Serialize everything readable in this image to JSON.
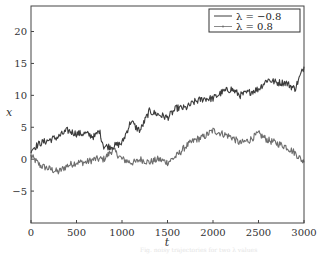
{
  "chart_data": {
    "type": "line",
    "title": "",
    "xlabel": "t",
    "ylabel": "x",
    "xlim": [
      0,
      3000
    ],
    "ylim": [
      -10,
      24
    ],
    "xticks": [
      0,
      500,
      1000,
      1500,
      2000,
      2500,
      3000
    ],
    "yticks": [
      -5,
      0,
      5,
      10,
      15,
      20
    ],
    "xtick_labels": [
      "0",
      "500",
      "1000",
      "1500",
      "2000",
      "2500",
      "3000"
    ],
    "ytick_labels": [
      "−5",
      "0",
      "5",
      "10",
      "15",
      "20"
    ],
    "grid": false,
    "legend_position": "upper right",
    "x": [
      0,
      100,
      200,
      300,
      400,
      500,
      600,
      700,
      750,
      800,
      900,
      1000,
      1100,
      1150,
      1200,
      1300,
      1400,
      1500,
      1600,
      1700,
      1800,
      1900,
      2000,
      2100,
      2200,
      2300,
      2400,
      2500,
      2600,
      2700,
      2800,
      2900,
      3000
    ],
    "series": [
      {
        "name": "λ = −0.8",
        "color": "#3c3c3c",
        "values": [
          1.5,
          2.5,
          3.0,
          3.5,
          4.5,
          4.0,
          4.0,
          3.5,
          4.5,
          2.0,
          2.0,
          2.5,
          6.0,
          5.0,
          4.5,
          7.5,
          7.0,
          6.5,
          8.0,
          8.0,
          9.0,
          9.5,
          9.5,
          10.5,
          11.0,
          10.0,
          10.5,
          11.0,
          12.5,
          12.0,
          12.0,
          11.0,
          14.5
        ]
      },
      {
        "name": "λ = 0.8",
        "color": "#6e6e6e",
        "values": [
          0.5,
          -1.0,
          -1.5,
          -2.0,
          -1.0,
          -0.5,
          -0.5,
          0.0,
          0.0,
          0.0,
          1.5,
          0.0,
          -0.5,
          -0.5,
          0.0,
          -0.5,
          0.0,
          -0.5,
          0.5,
          2.0,
          3.0,
          3.5,
          4.5,
          4.0,
          3.5,
          2.5,
          3.0,
          4.0,
          3.0,
          2.5,
          2.0,
          1.0,
          -0.5
        ]
      }
    ]
  },
  "caption": "Fig. noisy trajectories for two λ values"
}
